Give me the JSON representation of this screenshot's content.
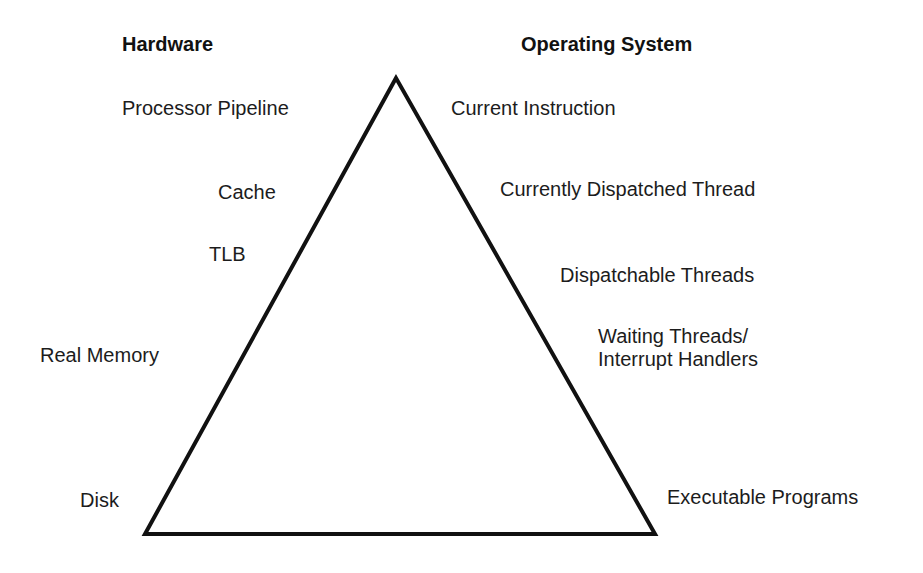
{
  "diagram": {
    "type": "pyramid",
    "headings": {
      "left": "Hardware",
      "right": "Operating System"
    },
    "hardware_levels": [
      {
        "label": "Processor Pipeline"
      },
      {
        "label": "Cache"
      },
      {
        "label": "TLB"
      },
      {
        "label": "Real Memory"
      },
      {
        "label": "Disk"
      }
    ],
    "os_levels": [
      {
        "label": "Current Instruction"
      },
      {
        "label": "Currently Dispatched Thread"
      },
      {
        "label": "Dispatchable Threads"
      },
      {
        "label": "Waiting Threads/",
        "label2": "Interrupt Handlers"
      },
      {
        "label": "Executable Programs"
      }
    ],
    "triangle": {
      "apex": [
        396,
        78
      ],
      "bottom_left": [
        145,
        534
      ],
      "bottom_right": [
        655,
        534
      ],
      "stroke_color": "#111111",
      "stroke_width": 4
    }
  }
}
